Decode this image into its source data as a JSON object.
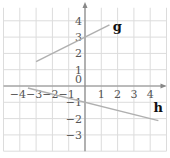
{
  "chart_data": {
    "type": "line",
    "title": "",
    "xlabel": "x",
    "ylabel": "y",
    "xlim": [
      -5,
      5
    ],
    "ylim": [
      -4,
      5
    ],
    "grid": true,
    "x_ticks": [
      "-4",
      "-3",
      "-2",
      "-1",
      "1",
      "2",
      "3",
      "4"
    ],
    "y_ticks": [
      "4",
      "3",
      "2",
      "1",
      "-1",
      "-2",
      "-3"
    ],
    "origin_label": "0",
    "series": [
      {
        "name": "g",
        "x": [
          -3,
          1.5
        ],
        "y": [
          1.5,
          3.75
        ],
        "slope": 0.5,
        "intercept": 3,
        "color": "#b0b0b0"
      },
      {
        "name": "h",
        "x": [
          -3.5,
          4.5
        ],
        "y": [
          -0.125,
          -2.125
        ],
        "slope": -0.25,
        "intercept": -1,
        "color": "#b0b0b0"
      }
    ],
    "labels": [
      {
        "text": "g",
        "x": 1.7,
        "y": 3.4
      },
      {
        "text": "h",
        "x": 4.2,
        "y": -1.6
      }
    ]
  },
  "colors": {
    "grid": "#dcdcdc",
    "axis": "#888888",
    "line": "#b0b0b0"
  }
}
